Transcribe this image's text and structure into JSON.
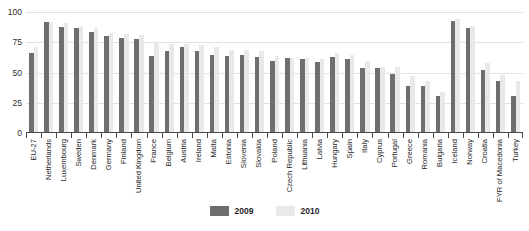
{
  "chart_data": {
    "type": "bar",
    "title": "",
    "subtitle": "",
    "xlabel": "",
    "ylabel": "",
    "ylim": [
      0,
      100
    ],
    "yticks": [
      0,
      25,
      50,
      75,
      100
    ],
    "grid": true,
    "legend_position": "bottom",
    "categories": [
      "EU-27",
      "Netherlands",
      "Luxembourg",
      "Sweden",
      "Denmark",
      "Germany",
      "Finland",
      "United Kingdom",
      "France",
      "Belgium",
      "Austria",
      "Ireland",
      "Malta",
      "Estonia",
      "Slovenia",
      "Slovakia",
      "Poland",
      "Czech Republic",
      "Lithuania",
      "Latvia",
      "Hungary",
      "Spain",
      "Italy",
      "Cyprus",
      "Portugal",
      "Greece",
      "Romania",
      "Bulgaria",
      "Iceland",
      "Norway",
      "Croatia",
      "FYR of Macedonia",
      "Turkey"
    ],
    "series": [
      {
        "name": "2009",
        "color": "#6e6e6e",
        "values": [
          65,
          91,
          87,
          86,
          83,
          79,
          78,
          77,
          63,
          67,
          70,
          67,
          64,
          63,
          64,
          62,
          59,
          61,
          60,
          58,
          62,
          60,
          53,
          53,
          48,
          38,
          38,
          30,
          92,
          86,
          51,
          42,
          30
        ]
      },
      {
        "name": "2010",
        "color": "#e9e9e9",
        "values": [
          70,
          91,
          90,
          88,
          86,
          82,
          81,
          80,
          74,
          73,
          73,
          72,
          70,
          68,
          68,
          67,
          63,
          61,
          61,
          60,
          65,
          64,
          59,
          54,
          54,
          46,
          42,
          33,
          93,
          88,
          57,
          47,
          42
        ]
      }
    ]
  },
  "legend": {
    "items": [
      {
        "label": "2009",
        "color": "#6e6e6e"
      },
      {
        "label": "2010",
        "color": "#e9e9e9"
      }
    ]
  }
}
